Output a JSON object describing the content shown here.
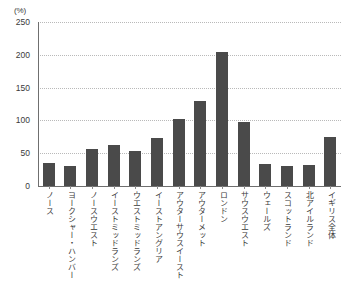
{
  "chart_data": {
    "type": "bar",
    "title": "",
    "subtitle": "",
    "unit_label": "(%)",
    "xlabel": "",
    "ylabel": "",
    "ylim": [
      0,
      250
    ],
    "yticks": [
      0,
      50,
      100,
      150,
      200,
      250
    ],
    "ytick_labels": [
      "0",
      "50",
      "100",
      "150",
      "200",
      "250"
    ],
    "grid": true,
    "grid_style": "dotted-horizontal",
    "legend": false,
    "legend_position": "none",
    "bar_color": "#4a4a4a",
    "categories": [
      "ノース",
      "ヨークシャー・ハンバー",
      "ノースウエスト",
      "イーストミッドランズ",
      "ウエストミッドランズ",
      "イーストアングリア",
      "アウターサウスイースト",
      "アウターメット",
      "ロンドン",
      "サウスウエスト",
      "ウェールズ",
      "スコットランド",
      "北アイルランド",
      "イギリス全体"
    ],
    "values": [
      35,
      30,
      57,
      62,
      53,
      73,
      102,
      130,
      205,
      98,
      33,
      30,
      32,
      75
    ]
  }
}
